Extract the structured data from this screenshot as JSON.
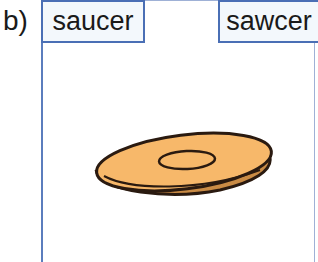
{
  "question": {
    "label": "b)",
    "options": [
      {
        "text": "saucer"
      },
      {
        "text": "sawcer"
      }
    ],
    "illustration": {
      "name": "saucer-illustration",
      "fill_color": "#f7b86a",
      "outline_color": "#2a1a10"
    }
  }
}
